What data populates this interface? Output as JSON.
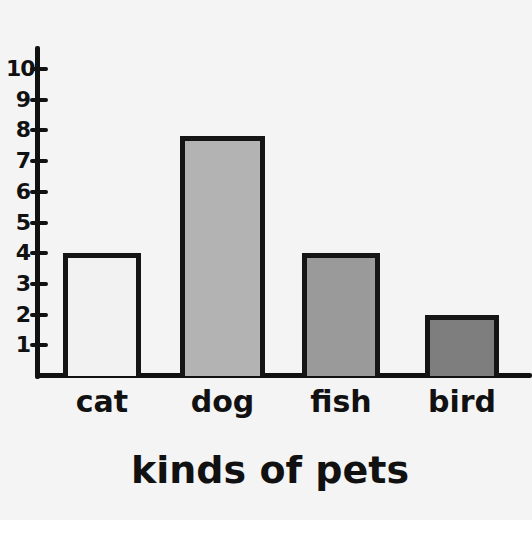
{
  "chart_data": {
    "type": "bar",
    "title": "",
    "xlabel": "kinds of pets",
    "ylabel": "",
    "categories": [
      "cat",
      "dog",
      "fish",
      "bird"
    ],
    "values": [
      4,
      8,
      4,
      2
    ],
    "yticks": [
      1,
      2,
      3,
      4,
      5,
      6,
      7,
      8,
      9,
      10
    ],
    "ylim": [
      0,
      10
    ],
    "grid": false,
    "legend": null,
    "bar_colors": [
      "#f2f2f2",
      "#b3b3b3",
      "#9a9a9a",
      "#7e7e7e"
    ]
  },
  "axis": {
    "y_tick_labels": [
      "1",
      "2",
      "3",
      "4",
      "5",
      "6",
      "7",
      "8",
      "9",
      "10"
    ],
    "x_title": "kinds of pets"
  },
  "bars": [
    {
      "label": "cat",
      "value": 4,
      "color": "#f2f2f2"
    },
    {
      "label": "dog",
      "value": 8,
      "color": "#b3b3b3"
    },
    {
      "label": "fish",
      "value": 4,
      "color": "#9a9a9a"
    },
    {
      "label": "bird",
      "value": 2,
      "color": "#7e7e7e"
    }
  ]
}
